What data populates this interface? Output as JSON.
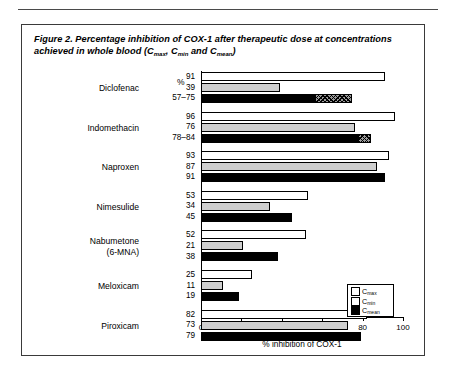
{
  "figure": {
    "title_prefix": "Figure 2. Percentage inhibition of COX-1 after therapeutic dose at concentrations achieved in whole blood (",
    "title_c1": "C",
    "title_c1_sub": "max",
    "title_sep1": ", ",
    "title_c2": "C",
    "title_c2_sub": "min",
    "title_sep2": " and ",
    "title_c3": "C",
    "title_c3_sub": "mean",
    "title_suffix": ")",
    "percent_header": "%"
  },
  "legend": {
    "position": "inside-right",
    "items": [
      {
        "label": "C",
        "sub": "max",
        "swatch": "white",
        "color": "#ffffff"
      },
      {
        "label": "C",
        "sub": "min",
        "swatch": "gray",
        "color": "#cfcfcf"
      },
      {
        "label": "C",
        "sub": "mean",
        "swatch": "black",
        "color": "#000000"
      }
    ]
  },
  "chart_data": {
    "type": "bar",
    "orientation": "horizontal",
    "title": "Figure 2. Percentage inhibition of COX-1 after therapeutic dose at concentrations achieved in whole blood (Cmax, Cmin and Cmean)",
    "xlabel": "% inhibition of COX-1",
    "ylabel": "",
    "xlim": [
      0,
      100
    ],
    "xticks": [
      0,
      20,
      40,
      60,
      80,
      100
    ],
    "xticklabels": [
      "0",
      "20",
      "40",
      "60",
      "80",
      "100"
    ],
    "grid": false,
    "value_column_header": "%",
    "categories": [
      "Diclofenac",
      "Indomethacin",
      "Naproxen",
      "Nimesulide",
      "Nabumetone (6-MNA)",
      "Meloxicam",
      "Piroxicam"
    ],
    "series": [
      {
        "name": "Cmax",
        "values": [
          91,
          96,
          93,
          53,
          52,
          25,
          82
        ]
      },
      {
        "name": "Cmin",
        "values": [
          39,
          76,
          87,
          34,
          21,
          11,
          73
        ]
      },
      {
        "name": "Cmean",
        "values": [
          57,
          78,
          91,
          45,
          38,
          19,
          79
        ]
      }
    ],
    "cmean_ranges": [
      {
        "category": "Diclofenac",
        "low": 57,
        "high": 75,
        "label": "57–75"
      },
      {
        "category": "Indomethacin",
        "low": 78,
        "high": 84,
        "label": "78–84"
      }
    ]
  },
  "groups": [
    {
      "name": "Diclofenac",
      "name_line2": "",
      "labels": [
        "91",
        "39",
        "57–75"
      ],
      "cmax": 91,
      "cmin": 39,
      "cmean": 57,
      "range_high": 75
    },
    {
      "name": "Indomethacin",
      "name_line2": "",
      "labels": [
        "96",
        "76",
        "78–84"
      ],
      "cmax": 96,
      "cmin": 76,
      "cmean": 78,
      "range_high": 84
    },
    {
      "name": "Naproxen",
      "name_line2": "",
      "labels": [
        "93",
        "87",
        "91"
      ],
      "cmax": 93,
      "cmin": 87,
      "cmean": 91,
      "range_high": null
    },
    {
      "name": "Nimesulide",
      "name_line2": "",
      "labels": [
        "53",
        "34",
        "45"
      ],
      "cmax": 53,
      "cmin": 34,
      "cmean": 45,
      "range_high": null
    },
    {
      "name": "Nabumetone",
      "name_line2": "(6-MNA)",
      "labels": [
        "52",
        "21",
        "38"
      ],
      "cmax": 52,
      "cmin": 21,
      "cmean": 38,
      "range_high": null
    },
    {
      "name": "Meloxicam",
      "name_line2": "",
      "labels": [
        "25",
        "11",
        "19"
      ],
      "cmax": 25,
      "cmin": 11,
      "cmean": 19,
      "range_high": null
    },
    {
      "name": "Piroxicam",
      "name_line2": "",
      "labels": [
        "82",
        "73",
        "79"
      ],
      "cmax": 82,
      "cmin": 73,
      "cmean": 79,
      "range_high": null
    }
  ]
}
